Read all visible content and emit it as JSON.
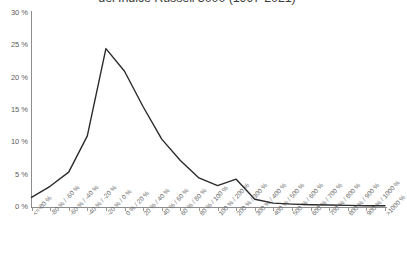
{
  "chart_data": {
    "type": "line",
    "title": "del Indice Russell 3000 (1997-2021)",
    "xlabel": "",
    "ylabel": "",
    "ylim": [
      0,
      30
    ],
    "yticks": [
      0,
      5,
      10,
      15,
      20,
      25,
      30
    ],
    "ytick_labels": [
      "0 %",
      "5 %",
      "10 %",
      "15 %",
      "20 %",
      "25 %",
      "30 %"
    ],
    "grid": false,
    "legend": "none",
    "categories": [
      "<=-80 %",
      "-80 % / -60 %",
      "-60 % / -40 %",
      "-40 % / -20 %",
      "-20 % / 0 %",
      "0 % / 20 %",
      "20 % / 40 %",
      "40 % / 60 %",
      "60 % / 80 %",
      "80 % / 100 %",
      "100 % / 200 %",
      "200 % / 300 %",
      "300 % / 400 %",
      "400 % / 500 %",
      "500 % / 600 %",
      "600 % / 700 %",
      "700 % / 800 %",
      "800 % / 900 %",
      "900 % / 1000 %",
      ">1000 %"
    ],
    "values": [
      1.5,
      3.2,
      5.4,
      11.0,
      24.5,
      21.0,
      15.5,
      10.5,
      7.2,
      4.5,
      3.3,
      4.3,
      1.2,
      0.6,
      0.45,
      0.35,
      0.3,
      0.25,
      0.2,
      0.2
    ],
    "series": [
      {
        "name": "Distribuzione dei rendimenti",
        "values": [
          1.5,
          3.2,
          5.4,
          11.0,
          24.5,
          21.0,
          15.5,
          10.5,
          7.2,
          4.5,
          3.3,
          4.3,
          1.2,
          0.6,
          0.45,
          0.35,
          0.3,
          0.25,
          0.2,
          0.2
        ]
      }
    ],
    "line_color": "#2b2b2b"
  }
}
